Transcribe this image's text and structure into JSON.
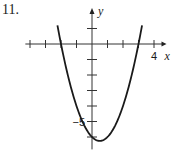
{
  "problem_number": "11.",
  "chart_data": {
    "type": "line",
    "title": "",
    "xlabel": "x",
    "ylabel": "y",
    "xlim": [
      -4,
      4
    ],
    "ylim": [
      -6.5,
      1.2
    ],
    "x_ticks": [
      -4,
      -3,
      -2,
      -1,
      1,
      2,
      3,
      4
    ],
    "y_ticks": [
      1,
      -1,
      -2,
      -3,
      -4,
      -5,
      -6
    ],
    "tick_labels": [
      {
        "axis": "x",
        "value": 4,
        "text": "4"
      },
      {
        "axis": "y",
        "value": -5,
        "text": "−5"
      }
    ],
    "grid": false,
    "series": [
      {
        "name": "parabola",
        "equation": "y = x^2 - x - 6",
        "x_domain": [
          -2.23,
          3.23
        ],
        "x_intercepts": [
          -2,
          3
        ],
        "y_intercept": -6,
        "vertex": [
          0.5,
          -6.25
        ]
      }
    ]
  }
}
